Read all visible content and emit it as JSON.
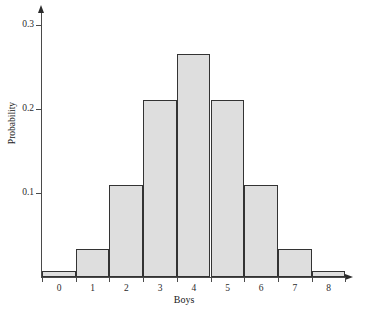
{
  "chart_data": {
    "type": "bar",
    "title": "",
    "subtitle": "",
    "xlabel": "Boys",
    "ylabel": "Probability",
    "categories": [
      "0",
      "1",
      "2",
      "3",
      "4",
      "5",
      "6",
      "7",
      "8"
    ],
    "values": [
      0.007,
      0.033,
      0.109,
      0.211,
      0.266,
      0.211,
      0.109,
      0.033,
      0.007
    ],
    "series": [
      {
        "name": "Probability",
        "values": [
          0.007,
          0.033,
          0.109,
          0.211,
          0.266,
          0.211,
          0.109,
          0.033,
          0.007
        ]
      }
    ],
    "xlim": [
      0,
      9
    ],
    "ylim": [
      0,
      0.31
    ],
    "y_ticks": [
      0.1,
      0.2,
      0.3
    ],
    "y_tick_labels": [
      "0.1",
      "0.2",
      "0.3"
    ],
    "x_tick_labels": [
      "0",
      "1",
      "2",
      "3",
      "4",
      "5",
      "6",
      "7",
      "8"
    ],
    "grid": false,
    "legend": false,
    "legend_position": "none",
    "bar_fill_color": "#dedede",
    "bar_edge_color": "#333333",
    "axis_color": "#4a4a4a",
    "background_color": "#ffffff"
  },
  "axes": {
    "y_arrow_icon": "axis-arrow-up",
    "x_arrow_icon": "axis-arrow-right"
  }
}
